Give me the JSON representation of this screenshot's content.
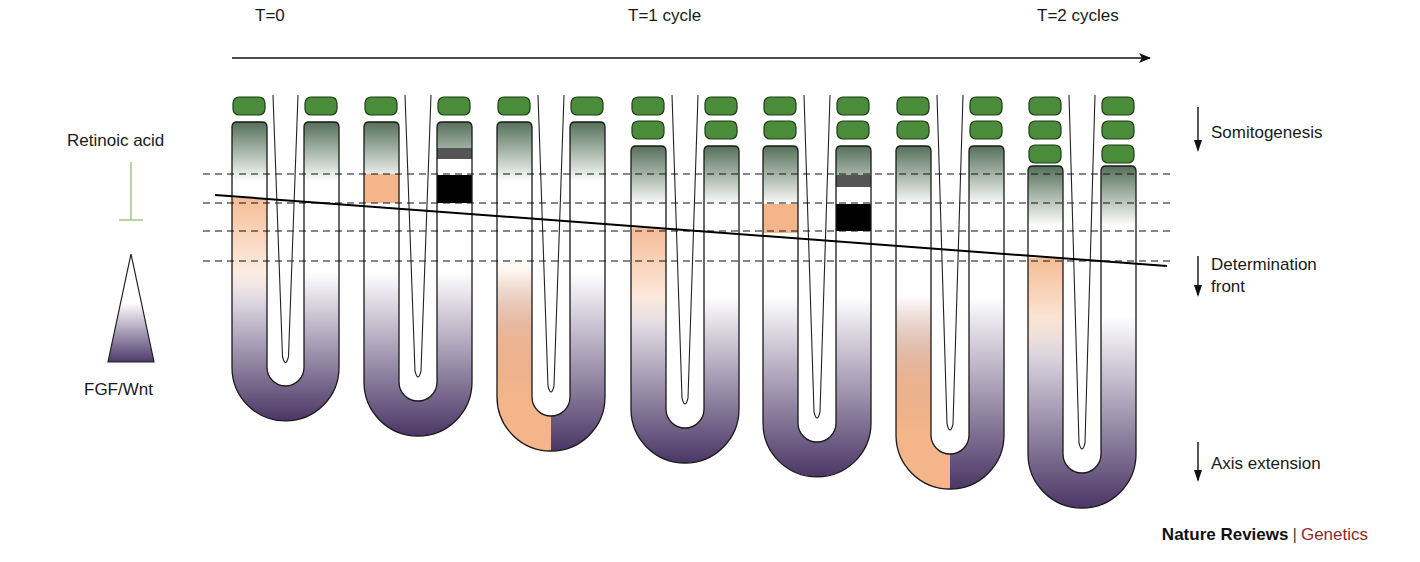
{
  "timeline": {
    "labels": [
      {
        "text": "T=0",
        "x": 255
      },
      {
        "text": "T=1 cycle",
        "x": 628
      },
      {
        "text": "T=2 cycles",
        "x": 1037
      }
    ],
    "arrow": {
      "x1": 232,
      "x2": 1150,
      "y": 58
    }
  },
  "left_legend": {
    "retinoic_acid": "Retinoic acid",
    "fgf_wnt": "FGF/Wnt",
    "inhibition_color": "#9bc47a",
    "gradient_dark": "#4e3a6b"
  },
  "right_legend": {
    "somitogenesis": "Somitogenesis",
    "determination_front_line1": "Determination",
    "determination_front_line2": "front",
    "axis_extension": "Axis extension"
  },
  "footer": {
    "brand": "Nature Reviews",
    "separator": "|",
    "journal": "Genetics"
  },
  "colors": {
    "somite": "#4a8c3a",
    "somite_border": "#1f3d17",
    "psm_green_top": "#55705a",
    "orange": "#f4b58a",
    "purple": "#4b3666",
    "black_band": "#000000",
    "gray_band": "#555555"
  },
  "dashed_lines_y": [
    174,
    203,
    231,
    261
  ],
  "determination_front_line": {
    "x1": 215,
    "y1": 195,
    "x2": 1167,
    "y2": 266
  },
  "embryos": [
    {
      "left_x": 232,
      "right_x": 304,
      "arm_w": 35,
      "somites": 1,
      "arm_top": 122,
      "bottom": 421,
      "left_band": {
        "type": "orange_fade",
        "y1": 198,
        "y2": 300
      },
      "right_band": null,
      "tail_orange_left": false
    },
    {
      "left_x": 364,
      "right_x": 437,
      "arm_w": 35,
      "somites": 1,
      "arm_top": 122,
      "bottom": 436,
      "left_band": {
        "type": "orange_solid",
        "y1": 174,
        "y2": 203
      },
      "right_band": {
        "type": "bw",
        "gray_y1": 148,
        "gray_y2": 159,
        "black_y1": 175,
        "black_y2": 203
      },
      "tail_orange_left": false
    },
    {
      "left_x": 497,
      "right_x": 570,
      "arm_w": 35,
      "somites": 1,
      "arm_top": 122,
      "bottom": 451,
      "left_band": null,
      "right_band": null,
      "tail_orange_left": true
    },
    {
      "left_x": 631,
      "right_x": 704,
      "arm_w": 35,
      "somites": 2,
      "arm_top": 146,
      "bottom": 463,
      "left_band": {
        "type": "orange_fade",
        "y1": 228,
        "y2": 330
      },
      "right_band": null,
      "tail_orange_left": false
    },
    {
      "left_x": 763,
      "right_x": 836,
      "arm_w": 35,
      "somites": 2,
      "arm_top": 146,
      "bottom": 477,
      "left_band": {
        "type": "orange_solid",
        "y1": 204,
        "y2": 233
      },
      "right_band": {
        "type": "bw",
        "gray_y1": 175,
        "gray_y2": 187,
        "black_y1": 204,
        "black_y2": 231
      },
      "tail_orange_left": false
    },
    {
      "left_x": 896,
      "right_x": 969,
      "arm_w": 35,
      "somites": 2,
      "arm_top": 146,
      "bottom": 489,
      "left_band": null,
      "right_band": null,
      "tail_orange_left": true
    },
    {
      "left_x": 1028,
      "right_x": 1101,
      "arm_w": 35,
      "somites": 3,
      "arm_top": 166,
      "bottom": 508,
      "left_band": {
        "type": "orange_fade",
        "y1": 258,
        "y2": 360
      },
      "right_band": null,
      "tail_orange_left": false
    }
  ]
}
